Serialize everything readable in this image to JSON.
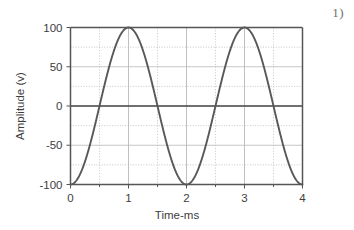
{
  "figure": {
    "number_label": "1)"
  },
  "chart_data": {
    "type": "line",
    "title": "",
    "subtitle": "",
    "xlabel": "Time-ms",
    "ylabel": "Amplitude (v)",
    "xlim": [
      0,
      4
    ],
    "ylim": [
      -100,
      100
    ],
    "xticks": [
      0,
      1,
      2,
      3,
      4
    ],
    "xtick_labels": [
      "0",
      "1",
      "2",
      "3",
      "4"
    ],
    "yticks": [
      -100,
      -50,
      0,
      50,
      100
    ],
    "ytick_labels": [
      "-100",
      "-50",
      "0",
      "50",
      "100"
    ],
    "x_minor_step": 0.5,
    "y_gridline_step": 25,
    "grid": true,
    "grid_color": "#b9b9b9",
    "zero_line_color": "#4a4a4a",
    "frame_color": "#555555",
    "legend": null,
    "legend_position": "none",
    "annotations": [],
    "series": [
      {
        "name": "waveform",
        "color": "#585858",
        "line_width": 1.9,
        "equation": "y = -100 * cos(pi * t)",
        "amplitude": 100,
        "period_ms": 2,
        "x": [
          0,
          0.1,
          0.2,
          0.3,
          0.4,
          0.5,
          0.6,
          0.7,
          0.8,
          0.9,
          1,
          1.1,
          1.2,
          1.3,
          1.4,
          1.5,
          1.6,
          1.7,
          1.8,
          1.9,
          2,
          2.1,
          2.2,
          2.3,
          2.4,
          2.5,
          2.6,
          2.7,
          2.8,
          2.9,
          3,
          3.1,
          3.2,
          3.3,
          3.4,
          3.5,
          3.6,
          3.7,
          3.8,
          3.9,
          4
        ],
        "values": [
          -100,
          -95.1,
          -80.9,
          -58.8,
          -30.9,
          0,
          30.9,
          58.8,
          80.9,
          95.1,
          100,
          95.1,
          80.9,
          58.8,
          30.9,
          0,
          -30.9,
          -58.8,
          -80.9,
          -95.1,
          -100,
          -95.1,
          -80.9,
          -58.8,
          -30.9,
          0,
          30.9,
          58.8,
          80.9,
          95.1,
          100,
          95.1,
          80.9,
          58.8,
          30.9,
          0,
          -30.9,
          -58.8,
          -80.9,
          -95.1,
          -100
        ]
      }
    ]
  }
}
